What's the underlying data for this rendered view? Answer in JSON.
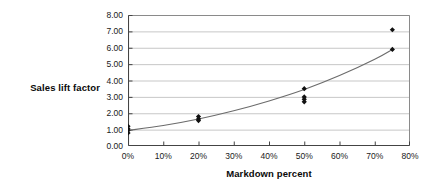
{
  "chart_data": {
    "type": "scatter",
    "title": "",
    "subtitle": "",
    "xlabel": "Markdown percent",
    "ylabel": "Sales lift factor",
    "xlim": [
      0,
      80
    ],
    "ylim": [
      0,
      8
    ],
    "x_tick_labels": [
      "0%",
      "10%",
      "20%",
      "30%",
      "40%",
      "50%",
      "60%",
      "70%",
      "80%"
    ],
    "x_ticks": [
      0,
      10,
      20,
      30,
      40,
      50,
      60,
      70,
      80
    ],
    "y_tick_labels": [
      "0.00",
      "1.00",
      "2.00",
      "3.00",
      "4.00",
      "5.00",
      "6.00",
      "7.00",
      "8.00"
    ],
    "y_ticks": [
      0,
      1,
      2,
      3,
      4,
      5,
      6,
      7,
      8
    ],
    "grid": "horizontal",
    "legend": "none",
    "marker": "diamond",
    "marker_color": "#111111",
    "trendline_color": "#6b6b6b",
    "series": [
      {
        "name": "Observations",
        "type": "scatter",
        "points": [
          {
            "x": 0,
            "y": 1.2
          },
          {
            "x": 0,
            "y": 1.05
          },
          {
            "x": 0,
            "y": 0.95
          },
          {
            "x": 0,
            "y": 0.8
          },
          {
            "x": 20,
            "y": 1.8
          },
          {
            "x": 20,
            "y": 1.65
          },
          {
            "x": 20,
            "y": 1.55
          },
          {
            "x": 50,
            "y": 3.5
          },
          {
            "x": 50,
            "y": 3.0
          },
          {
            "x": 50,
            "y": 2.85
          },
          {
            "x": 50,
            "y": 2.7
          },
          {
            "x": 75,
            "y": 7.1
          },
          {
            "x": 75,
            "y": 5.9
          }
        ]
      },
      {
        "name": "Fitted trend",
        "type": "line",
        "points": [
          {
            "x": 0,
            "y": 0.95
          },
          {
            "x": 10,
            "y": 1.25
          },
          {
            "x": 20,
            "y": 1.65
          },
          {
            "x": 30,
            "y": 2.15
          },
          {
            "x": 40,
            "y": 2.75
          },
          {
            "x": 50,
            "y": 3.45
          },
          {
            "x": 60,
            "y": 4.3
          },
          {
            "x": 70,
            "y": 5.3
          },
          {
            "x": 75,
            "y": 5.9
          }
        ]
      }
    ]
  }
}
